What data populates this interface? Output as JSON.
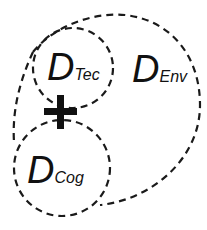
{
  "diagram": {
    "nodes": [
      {
        "id": "env",
        "main": "D",
        "sub": "Env"
      },
      {
        "id": "tec",
        "main": "D",
        "sub": "Tec"
      },
      {
        "id": "cog",
        "main": "D",
        "sub": "Cog"
      }
    ],
    "operator": {
      "symbol": "plus-icon",
      "between": [
        "tec",
        "cog"
      ]
    },
    "line_style": "dashed",
    "colors": {
      "stroke": "#1a1a1a",
      "background": "#ffffff"
    }
  }
}
